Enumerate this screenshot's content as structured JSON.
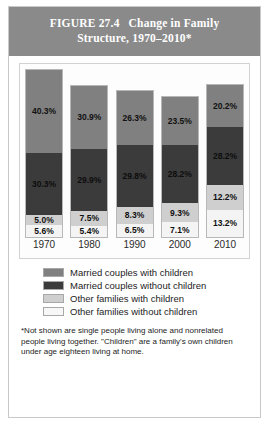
{
  "figure": {
    "title_number": "FIGURE 27.4",
    "title_text": "Change in Family",
    "title_line2": "Structure, 1970–2010*",
    "footnote": "*Not shown are single people living alone and nonrelated people living together. \"Children\" are a family's own children under age eighteen living at home."
  },
  "legend": {
    "items": [
      {
        "label": "Married couples with children",
        "color": "#808080"
      },
      {
        "label": "Married couples without children",
        "color": "#3b3b3b"
      },
      {
        "label": "Other families with children",
        "color": "#cfcfcf"
      },
      {
        "label": "Other families without children",
        "color": "#f7f7f7"
      }
    ]
  },
  "chart_data": {
    "type": "bar",
    "xlabel": "",
    "ylabel": "Percent of households",
    "stacked": true,
    "grid": false,
    "legend_position": "below",
    "categories": [
      "1970",
      "1980",
      "1990",
      "2000",
      "2010"
    ],
    "series": [
      {
        "name": "Married couples with children",
        "color": "#808080",
        "values": [
          40.3,
          30.9,
          26.3,
          23.5,
          20.2
        ]
      },
      {
        "name": "Married couples without children",
        "color": "#3b3b3b",
        "values": [
          30.3,
          29.9,
          29.8,
          28.2,
          28.2
        ]
      },
      {
        "name": "Other families with children",
        "color": "#cfcfcf",
        "values": [
          5.0,
          7.5,
          8.3,
          9.3,
          12.2
        ]
      },
      {
        "name": "Other families without children",
        "color": "#f7f7f7",
        "values": [
          5.6,
          5.4,
          6.5,
          7.1,
          13.2
        ]
      }
    ],
    "totals": [
      81.2,
      73.7,
      70.9,
      68.1,
      73.8
    ],
    "value_suffix": "%",
    "bars": [
      {
        "category": "1970",
        "total": 81.2,
        "segments": [
          {
            "series": "Married couples with children",
            "value": 40.3,
            "label": "40.3%"
          },
          {
            "series": "Married couples without children",
            "value": 30.3,
            "label": "30.3%"
          },
          {
            "series": "Other families with children",
            "value": 5.0,
            "label": "5.0%"
          },
          {
            "series": "Other families without children",
            "value": 5.6,
            "label": "5.6%"
          }
        ]
      },
      {
        "category": "1980",
        "total": 73.7,
        "segments": [
          {
            "series": "Married couples with children",
            "value": 30.9,
            "label": "30.9%"
          },
          {
            "series": "Married couples without children",
            "value": 29.9,
            "label": "29.9%"
          },
          {
            "series": "Other families with children",
            "value": 7.5,
            "label": "7.5%"
          },
          {
            "series": "Other families without children",
            "value": 5.4,
            "label": "5.4%"
          }
        ]
      },
      {
        "category": "1990",
        "total": 70.9,
        "segments": [
          {
            "series": "Married couples with children",
            "value": 26.3,
            "label": "26.3%"
          },
          {
            "series": "Married couples without children",
            "value": 29.8,
            "label": "29.8%"
          },
          {
            "series": "Other families with children",
            "value": 8.3,
            "label": "8.3%"
          },
          {
            "series": "Other families without children",
            "value": 6.5,
            "label": "6.5%"
          }
        ]
      },
      {
        "category": "2000",
        "total": 68.1,
        "segments": [
          {
            "series": "Married couples with children",
            "value": 23.5,
            "label": "23.5%"
          },
          {
            "series": "Married couples without children",
            "value": 28.2,
            "label": "28.2%"
          },
          {
            "series": "Other families with children",
            "value": 9.3,
            "label": "9.3%"
          },
          {
            "series": "Other families without children",
            "value": 7.1,
            "label": "7.1%"
          }
        ]
      },
      {
        "category": "2010",
        "total": 73.8,
        "segments": [
          {
            "series": "Married couples with children",
            "value": 20.2,
            "label": "20.2%"
          },
          {
            "series": "Married couples without children",
            "value": 28.2,
            "label": "28.2%"
          },
          {
            "series": "Other families with children",
            "value": 12.2,
            "label": "12.2%"
          },
          {
            "series": "Other families without children",
            "value": 13.2,
            "label": "13.2%"
          }
        ]
      }
    ]
  }
}
